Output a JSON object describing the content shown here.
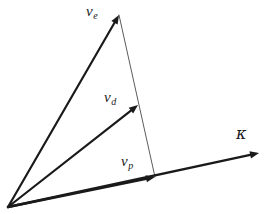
{
  "figure": {
    "type": "vector-diagram",
    "background_color": "#ffffff",
    "stroke_color": "#1a1a1a",
    "thin_stroke_color": "#4a4a4a",
    "width": 264,
    "height": 214,
    "origin": {
      "x": 8,
      "y": 207
    }
  },
  "labels": {
    "ve": {
      "base": "v",
      "sub": "e"
    },
    "vd": {
      "base": "v",
      "sub": "d"
    },
    "vp": {
      "base": "v",
      "sub": "p"
    },
    "kappa": {
      "text": "κ"
    }
  },
  "vectors": [
    {
      "name": "ve",
      "label_base": "v",
      "label_sub": "e",
      "from": {
        "x": 8,
        "y": 207
      },
      "to": {
        "x": 119,
        "y": 15
      },
      "stroke_width": 2.2,
      "arrow_size": 9
    },
    {
      "name": "vd",
      "label_base": "v",
      "label_sub": "d",
      "from": {
        "x": 8,
        "y": 207
      },
      "to": {
        "x": 138,
        "y": 105
      },
      "stroke_width": 2.2,
      "arrow_size": 9
    },
    {
      "name": "vp",
      "label_base": "v",
      "label_sub": "p",
      "from": {
        "x": 8,
        "y": 207
      },
      "to": {
        "x": 155,
        "y": 177
      },
      "stroke_width": 2.4,
      "arrow_size": 9
    },
    {
      "name": "kappa",
      "label_base": "κ",
      "label_sub": "",
      "from": {
        "x": 8,
        "y": 207
      },
      "to": {
        "x": 259,
        "y": 153
      },
      "stroke_width": 2.4,
      "arrow_size": 9
    }
  ],
  "connector_line": {
    "name": "ve-to-vp-connector",
    "from": {
      "x": 119,
      "y": 15
    },
    "to": {
      "x": 155,
      "y": 177
    },
    "stroke_width": 0.9
  }
}
